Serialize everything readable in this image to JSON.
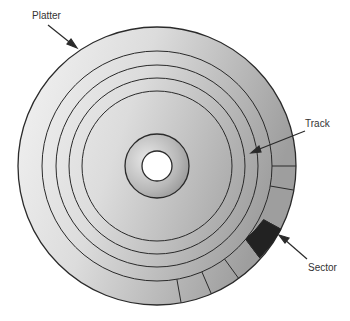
{
  "labels": {
    "platter": "Platter",
    "track": "Track",
    "sector": "Sector"
  },
  "geometry": {
    "center": [
      157,
      166
    ],
    "platter_radius": 139,
    "track_radii": [
      115,
      101,
      88,
      75
    ],
    "hub_radius": 32,
    "hole_radius": 15,
    "sector_inner_radius": 115,
    "sector_outer_radius": 139
  },
  "colors": {
    "stroke": "#2a2a2a",
    "platter_light": "#f2f2f2",
    "platter_dark": "#a8a8a8",
    "sector_highlight": "#222222",
    "background": "#ffffff"
  }
}
